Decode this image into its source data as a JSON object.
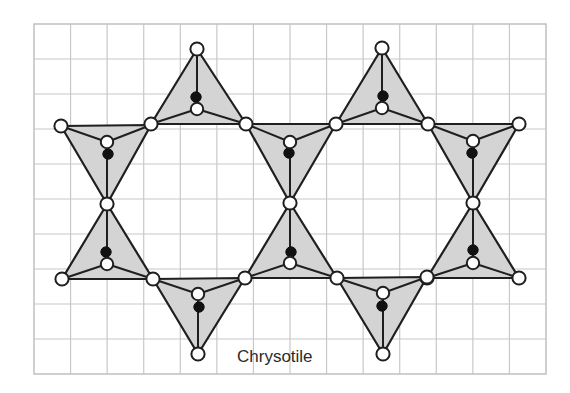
{
  "caption": "Chrysotile",
  "colors": {
    "grid": "#c8c8c8",
    "tetrahedron_fill": "#d4d4d4",
    "outline": "#1f1f1f",
    "oxygen_atom": "#ffffff",
    "silicon_atom": "#111111",
    "caption_text": "#2b2b2b"
  },
  "legend": {
    "open_circle": "oxygen-atom",
    "filled_circle": "silicon-atom",
    "gray_triangle": "SiO4-tetrahedron"
  },
  "grid": {
    "x0": 34,
    "y0": 24,
    "x1": 546,
    "y1": 374,
    "columns": 14,
    "rows": 10
  },
  "tetrahedra": [
    {
      "id": "top-left",
      "corners": [
        [
          197,
          49
        ],
        [
          151,
          124
        ],
        [
          246,
          124
        ]
      ],
      "inner_o": [
        197,
        109
      ],
      "si": [
        196,
        97
      ]
    },
    {
      "id": "top-right",
      "corners": [
        [
          382,
          48
        ],
        [
          336,
          124
        ],
        [
          428,
          124
        ]
      ],
      "inner_o": [
        382,
        108
      ],
      "si": [
        383,
        96
      ]
    },
    {
      "id": "left-upper",
      "corners": [
        [
          61,
          126
        ],
        [
          151,
          125
        ],
        [
          107,
          204
        ]
      ],
      "inner_o": [
        107,
        142
      ],
      "si": [
        108,
        154
      ]
    },
    {
      "id": "center-upper",
      "corners": [
        [
          246,
          124
        ],
        [
          336,
          124
        ],
        [
          290,
          203
        ]
      ],
      "inner_o": [
        290,
        142
      ],
      "si": [
        289,
        153
      ]
    },
    {
      "id": "right-upper",
      "corners": [
        [
          428,
          124
        ],
        [
          519,
          124
        ],
        [
          473,
          203
        ]
      ],
      "inner_o": [
        473,
        141
      ],
      "si": [
        472,
        153
      ]
    },
    {
      "id": "left-lower",
      "corners": [
        [
          107,
          204
        ],
        [
          62,
          279
        ],
        [
          153,
          279
        ]
      ],
      "inner_o": [
        107,
        264
      ],
      "si": [
        106,
        252
      ]
    },
    {
      "id": "center-lower",
      "corners": [
        [
          290,
          203
        ],
        [
          245,
          278
        ],
        [
          337,
          278
        ]
      ],
      "inner_o": [
        290,
        263
      ],
      "si": [
        291,
        252
      ]
    },
    {
      "id": "right-lower",
      "corners": [
        [
          473,
          203
        ],
        [
          427,
          278
        ],
        [
          519,
          278
        ]
      ],
      "inner_o": [
        473,
        263
      ],
      "si": [
        473,
        250
      ]
    },
    {
      "id": "bottom-left",
      "corners": [
        [
          153,
          279
        ],
        [
          245,
          278
        ],
        [
          198,
          354
        ]
      ],
      "inner_o": [
        198,
        294
      ],
      "si": [
        199,
        307
      ]
    },
    {
      "id": "bottom-right",
      "corners": [
        [
          337,
          278
        ],
        [
          427,
          277
        ],
        [
          383,
          354
        ]
      ],
      "inner_o": [
        383,
        293
      ],
      "si": [
        382,
        306
      ]
    }
  ]
}
